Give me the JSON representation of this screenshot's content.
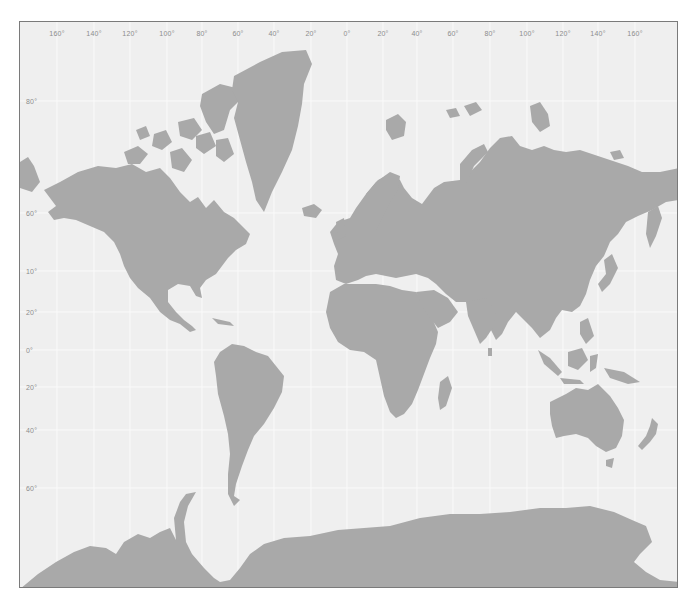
{
  "map": {
    "projection": "Mercator",
    "colors": {
      "ocean": "#efefef",
      "land": "#a9a9a9",
      "gridline": "#fafafa",
      "border": "#7a7a7a",
      "label": "#8c8c8c"
    },
    "longitude_labels": [
      {
        "text": "160°",
        "x": 37
      },
      {
        "text": "140°",
        "x": 74
      },
      {
        "text": "120°",
        "x": 110
      },
      {
        "text": "100°",
        "x": 147
      },
      {
        "text": "80°",
        "x": 182
      },
      {
        "text": "60°",
        "x": 218
      },
      {
        "text": "40°",
        "x": 254
      },
      {
        "text": "20°",
        "x": 291
      },
      {
        "text": "0°",
        "x": 327
      },
      {
        "text": "20°",
        "x": 363
      },
      {
        "text": "40°",
        "x": 397
      },
      {
        "text": "60°",
        "x": 433
      },
      {
        "text": "80°",
        "x": 470
      },
      {
        "text": "100°",
        "x": 507
      },
      {
        "text": "120°",
        "x": 543
      },
      {
        "text": "140°",
        "x": 578
      },
      {
        "text": "160°",
        "x": 615
      }
    ],
    "latitude_labels": [
      {
        "text": "80°",
        "y": 79
      },
      {
        "text": "60°",
        "y": 191
      },
      {
        "text": "10°",
        "y": 249
      },
      {
        "text": "20°",
        "y": 290
      },
      {
        "text": "0°",
        "y": 328
      },
      {
        "text": "20°",
        "y": 365
      },
      {
        "text": "40°",
        "y": 408
      },
      {
        "text": "60°",
        "y": 466
      }
    ],
    "regions": [
      "North America",
      "Greenland",
      "Canadian Arctic Archipelago",
      "South America",
      "Europe",
      "Africa",
      "Madagascar",
      "Asia",
      "Japan",
      "Indonesia",
      "Australia",
      "Tasmania",
      "New Zealand",
      "Antarctica",
      "Svalbard",
      "Novaya Zemlya",
      "Iceland",
      "Kamchatka",
      "Severnaya Zemlya"
    ]
  }
}
